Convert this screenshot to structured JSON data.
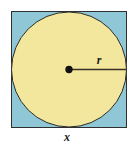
{
  "figure": {
    "background_color": "#ffffff",
    "square": {
      "name": "outer-square",
      "fill_color": "#8FC7D6",
      "stroke_color": "#2f2f2f",
      "stroke_width": 1,
      "x": 11,
      "y": 11,
      "side": 116,
      "label": "x"
    },
    "circle": {
      "name": "inscribed-circle",
      "fill_color": "#F2E79C",
      "stroke_color": "#2b2b2b",
      "stroke_width": 1,
      "center_x": 69,
      "center_y": 69,
      "radius": 58,
      "label": "r"
    },
    "center_point": {
      "name": "circle-center-dot",
      "color": "#111111",
      "x": 69,
      "y": 69,
      "radius": 3.6
    },
    "radius_line": {
      "name": "radius-segment",
      "color": "#3a3228",
      "stroke_width": 1.4,
      "x1": 69,
      "y1": 69,
      "x2": 127,
      "y2": 69
    },
    "labels": {
      "radius_label": "r",
      "radius_label_x": 99,
      "radius_label_y": 64,
      "side_label": "x",
      "side_label_x": 67,
      "side_label_y": 141
    }
  }
}
